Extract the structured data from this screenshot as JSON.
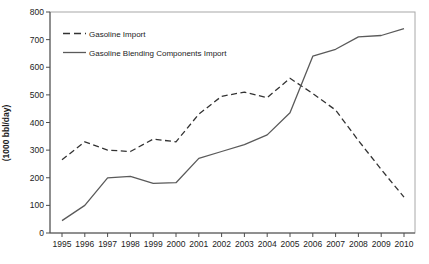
{
  "chart_data": {
    "type": "line",
    "title": "",
    "xlabel": "",
    "ylabel": "(1000 bbl/day)",
    "x": [
      1995,
      1996,
      1997,
      1998,
      1999,
      2000,
      2001,
      2002,
      2003,
      2004,
      2005,
      2006,
      2007,
      2008,
      2009,
      2010
    ],
    "series": [
      {
        "name": "Gasoline Import",
        "style": "dashed",
        "color": "#333333",
        "values": [
          265,
          330,
          300,
          295,
          340,
          330,
          430,
          495,
          510,
          490,
          560,
          505,
          445,
          335,
          230,
          130
        ]
      },
      {
        "name": "Gasoline Blending Components Import",
        "style": "solid",
        "color": "#5a5a5a",
        "values": [
          45,
          100,
          200,
          205,
          180,
          182,
          270,
          295,
          320,
          355,
          435,
          640,
          665,
          710,
          715,
          740
        ]
      }
    ],
    "ylim": [
      0,
      800
    ],
    "yticks": [
      0,
      100,
      200,
      300,
      400,
      500,
      600,
      700,
      800
    ],
    "grid": false,
    "legend_position": "top-left",
    "frame_color": "#a8a8a8",
    "axis_color": "#4d4d4d"
  }
}
